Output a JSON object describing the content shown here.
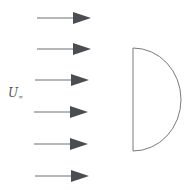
{
  "diagram": {
    "freestream_label": {
      "symbol": "U",
      "subscript": "∞"
    },
    "flow_arrow_count": 6,
    "body_shape": "half-cylinder (flat face upstream)",
    "colors": {
      "arrow": "#4a4d52",
      "arrow_line": "#6b6e72",
      "body_outline": "#7a7a7a",
      "label": "#555555"
    }
  }
}
